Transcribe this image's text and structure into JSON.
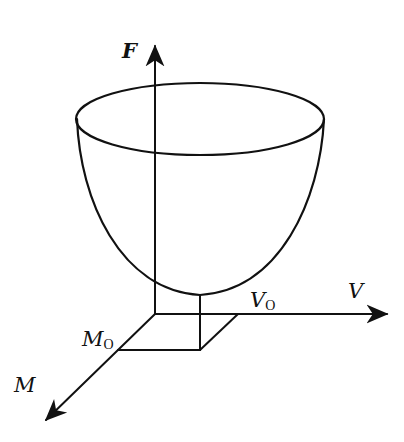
{
  "diagram": {
    "type": "3d-surface-sketch",
    "axes": {
      "vertical": {
        "label": "F"
      },
      "right": {
        "label": "V"
      },
      "diagonal": {
        "label": "M"
      }
    },
    "points": {
      "v0": {
        "main": "V",
        "sub": "O"
      },
      "m0": {
        "main": "M",
        "sub": "O"
      }
    },
    "colors": {
      "line": "#111111",
      "background": "#ffffff"
    }
  }
}
